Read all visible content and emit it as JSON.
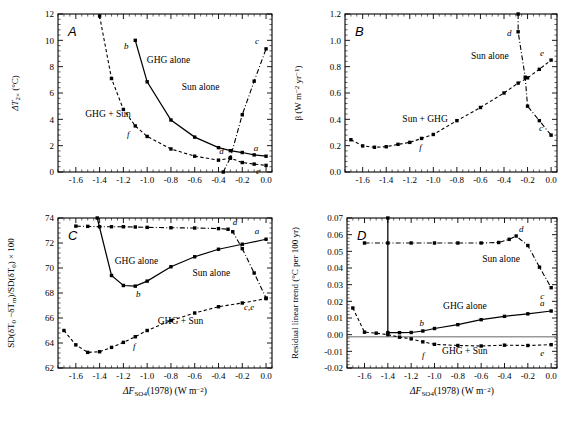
{
  "figure": {
    "xaxis_title": "ΔF",
    "xaxis_title_sub": "SO",
    "xaxis_title_sub2": "4",
    "xaxis_title_rest": "(1978) (W m",
    "xaxis_title_sup": "−2",
    "xaxis_title_end": ")",
    "xticks": [
      "-1.6",
      "-1.4",
      "-1.2",
      "-1.0",
      "-0.8",
      "-0.6",
      "-0.4",
      "-0.2",
      "0.0"
    ],
    "xlim": [
      -1.75,
      0.05
    ],
    "xtick_values": [
      -1.6,
      -1.4,
      -1.2,
      -1.0,
      -0.8,
      -0.6,
      -0.4,
      -0.2,
      0.0
    ]
  },
  "chart_data": [
    {
      "type": "line",
      "panel": "A",
      "title": "",
      "xlabel": "ΔF_SO4(1978) (W m−2)",
      "ylabel": "ΔT2x (°C)",
      "ylabel_main": "ΔT",
      "ylabel_sub": "2×",
      "ylabel_unit": "(°C)",
      "xlim": [
        -1.75,
        0.05
      ],
      "ylim": [
        0,
        12
      ],
      "yticks": [
        "0",
        "2",
        "4",
        "6",
        "8",
        "10",
        "12"
      ],
      "ytick_values": [
        0,
        2,
        4,
        6,
        8,
        10,
        12
      ],
      "grid": false,
      "series": [
        {
          "name": "GHG alone",
          "style": "solid",
          "label_x": -0.82,
          "label_y": 8.3,
          "x": [
            -1.1,
            -1.0,
            -0.8,
            -0.6,
            -0.4,
            -0.3,
            -0.2,
            -0.1,
            0.0
          ],
          "y": [
            10.0,
            6.85,
            3.95,
            2.65,
            1.85,
            1.62,
            1.48,
            1.3,
            1.2
          ]
        },
        {
          "name": "GHG + Sun",
          "style": "dashed",
          "label_x": -1.33,
          "label_y": 4.2,
          "x": [
            -1.4,
            -1.3,
            -1.2,
            -1.1,
            -1.0,
            -0.8,
            -0.6,
            -0.4,
            -0.3,
            -0.2,
            -0.1,
            0.0
          ],
          "y": [
            11.85,
            7.1,
            4.75,
            3.5,
            2.7,
            1.75,
            1.2,
            0.9,
            1.05,
            0.72,
            0.6,
            0.5
          ]
        },
        {
          "name": "Sun alone",
          "style": "dashdot",
          "label_x": -0.55,
          "label_y": 6.2,
          "x": [
            -0.36,
            -0.3,
            -0.2,
            -0.1,
            0.0
          ],
          "y": [
            0.0,
            1.1,
            4.35,
            6.9,
            9.35
          ]
        }
      ],
      "point_labels": [
        {
          "id": "a",
          "x": 0.0,
          "y": 1.2,
          "dx": -10,
          "dy": -5
        },
        {
          "id": "b",
          "x": -1.1,
          "y": 10.0,
          "dx": -9,
          "dy": 9
        },
        {
          "id": "c",
          "x": 0.0,
          "y": 9.35,
          "dx": -9,
          "dy": -5
        },
        {
          "id": "d",
          "x": -0.3,
          "y": 1.1,
          "dx": -9,
          "dy": -4
        },
        {
          "id": "e",
          "x": 0.0,
          "y": 0.5,
          "dx": -8,
          "dy": 9
        },
        {
          "id": "f",
          "x": -1.1,
          "y": 3.5,
          "dx": -7,
          "dy": 11
        }
      ]
    },
    {
      "type": "line",
      "panel": "B",
      "title": "",
      "xlabel": "ΔF_SO4(1978) (W m−2)",
      "ylabel": "β (W m−2 yr−1)",
      "ylabel_main": "β (W m",
      "ylabel_sup1": "−2",
      "ylabel_mid": " yr",
      "ylabel_sup2": "−1",
      "ylabel_end": ")",
      "xlim": [
        -1.75,
        0.05
      ],
      "ylim": [
        0.0,
        1.2
      ],
      "yticks": [
        "0.0",
        "0.2",
        "0.4",
        "0.6",
        "0.8",
        "1.0",
        "1.2"
      ],
      "ytick_values": [
        0.0,
        0.2,
        0.4,
        0.6,
        0.8,
        1.0,
        1.2
      ],
      "grid": false,
      "series": [
        {
          "name": "Sun + GHG",
          "style": "dashed",
          "label_x": -1.07,
          "label_y": 0.38,
          "x": [
            -1.7,
            -1.6,
            -1.5,
            -1.4,
            -1.3,
            -1.2,
            -1.1,
            -1.0,
            -0.8,
            -0.6,
            -0.4,
            -0.28,
            -0.2,
            -0.1,
            0.0
          ],
          "y": [
            0.245,
            0.198,
            0.188,
            0.192,
            0.21,
            0.225,
            0.255,
            0.285,
            0.39,
            0.49,
            0.6,
            0.675,
            0.715,
            0.78,
            0.85
          ]
        },
        {
          "name": "Sun alone",
          "style": "dashdot",
          "label_x": -0.52,
          "label_y": 0.855,
          "x": [
            -0.28,
            -0.28,
            -0.22,
            -0.2,
            -0.1,
            0.0
          ],
          "y": [
            1.2,
            1.065,
            0.72,
            0.5,
            0.39,
            0.28
          ]
        }
      ],
      "point_labels": [
        {
          "id": "c",
          "x": 0.0,
          "y": 0.28,
          "dx": -10,
          "dy": -4
        },
        {
          "id": "d",
          "x": -0.28,
          "y": 1.065,
          "dx": -9,
          "dy": 4
        },
        {
          "id": "e",
          "x": 0.0,
          "y": 0.85,
          "dx": -9,
          "dy": -4
        },
        {
          "id": "f",
          "x": -1.1,
          "y": 0.255,
          "dx": -1,
          "dy": 12
        }
      ]
    },
    {
      "type": "line",
      "panel": "C",
      "title": "",
      "xlabel": "ΔF_SO4(1978) (W m−2)",
      "ylabel": "SD(δT0 -δTm)/SD(δT0) × 100",
      "ylabel_p1": "SD(δT",
      "ylabel_s1": "0",
      "ylabel_p2": " −δT",
      "ylabel_s2": "m",
      "ylabel_p3": ")/SD(δT",
      "ylabel_s3": "0",
      "ylabel_p4": ") × 100",
      "xlim": [
        -1.75,
        0.05
      ],
      "ylim": [
        62,
        74
      ],
      "yticks": [
        "62",
        "64",
        "66",
        "68",
        "70",
        "72",
        "74"
      ],
      "ytick_values": [
        62,
        64,
        66,
        68,
        70,
        72,
        74
      ],
      "grid": false,
      "series": [
        {
          "name": "GHG alone",
          "style": "solid",
          "label_x": -1.09,
          "label_y": 70.3,
          "x": [
            -1.42,
            -1.3,
            -1.2,
            -1.1,
            -1.0,
            -0.8,
            -0.6,
            -0.4,
            -0.2,
            0.0
          ],
          "y": [
            74.0,
            69.4,
            68.6,
            68.55,
            68.95,
            70.1,
            70.9,
            71.5,
            71.9,
            72.3
          ]
        },
        {
          "name": "GHG + Sun",
          "style": "dashed",
          "label_x": -0.72,
          "label_y": 65.5,
          "x": [
            -1.7,
            -1.6,
            -1.5,
            -1.4,
            -1.3,
            -1.2,
            -1.1,
            -1.0,
            -0.8,
            -0.6,
            -0.4,
            -0.2,
            0.0
          ],
          "y": [
            65.0,
            63.85,
            63.25,
            63.3,
            63.65,
            64.05,
            64.5,
            65.0,
            65.8,
            66.4,
            66.9,
            67.2,
            67.55
          ]
        },
        {
          "name": "Sun alone",
          "style": "dashdot",
          "label_x": -0.46,
          "label_y": 69.4,
          "x": [
            -1.6,
            -1.5,
            -1.4,
            -1.3,
            -1.2,
            -1.1,
            -1.0,
            -0.8,
            -0.6,
            -0.4,
            -0.32,
            -0.28,
            -0.2,
            -0.1,
            0.0
          ],
          "y": [
            73.35,
            73.33,
            73.3,
            73.3,
            73.3,
            73.28,
            73.25,
            73.22,
            73.2,
            73.15,
            73.1,
            72.9,
            71.55,
            69.6,
            67.6
          ]
        }
      ],
      "point_labels": [
        {
          "id": "a",
          "x": 0.0,
          "y": 72.3,
          "dx": -9,
          "dy": -5
        },
        {
          "id": "b",
          "x": -1.1,
          "y": 68.55,
          "dx": 3,
          "dy": 11
        },
        {
          "id": "c,e",
          "x": 0.0,
          "y": 67.55,
          "dx": -17,
          "dy": 11
        },
        {
          "id": "d",
          "x": -0.32,
          "y": 73.1,
          "dx": 7,
          "dy": -4
        },
        {
          "id": "f",
          "x": -1.1,
          "y": 64.5,
          "dx": -1,
          "dy": 12
        }
      ]
    },
    {
      "type": "line",
      "panel": "D",
      "title": "",
      "xlabel": "ΔF_SO4(1978) (W m−2)",
      "ylabel": "Residual linear trend (°C per 100 yr)",
      "xlim": [
        -1.75,
        0.05
      ],
      "ylim": [
        -0.02,
        0.07
      ],
      "yticks": [
        "-0.02",
        "-0.01",
        "0.00",
        "0.01",
        "0.02",
        "0.03",
        "0.04",
        "0.05",
        "0.06",
        "0.07"
      ],
      "ytick_values": [
        -0.02,
        -0.01,
        0.0,
        0.01,
        0.02,
        0.03,
        0.04,
        0.05,
        0.06,
        0.07
      ],
      "grid": false,
      "zero_line": -0.0013,
      "series": [
        {
          "name": "GHG alone",
          "style": "solid",
          "label_x": -0.74,
          "label_y": 0.0155,
          "x": [
            -1.4,
            -1.4,
            -1.3,
            -1.2,
            -1.1,
            -1.0,
            -0.8,
            -0.6,
            -0.4,
            -0.2,
            0.0
          ],
          "y": [
            0.07,
            0.0012,
            0.0012,
            0.0013,
            0.0022,
            0.0037,
            0.006,
            0.009,
            0.011,
            0.0125,
            0.0142
          ]
        },
        {
          "name": "GHG + Sun",
          "style": "dashed",
          "label_x": -0.74,
          "label_y": -0.0115,
          "x": [
            -1.7,
            -1.6,
            -1.5,
            -1.4,
            -1.3,
            -1.2,
            -1.1,
            -1.0,
            -0.8,
            -0.6,
            -0.4,
            -0.2,
            0.0
          ],
          "y": [
            0.016,
            0.0015,
            0.0009,
            0.0,
            -0.0015,
            -0.0025,
            -0.0043,
            -0.0058,
            -0.0065,
            -0.0068,
            -0.0063,
            -0.0065,
            -0.006
          ]
        },
        {
          "name": "Sun alone",
          "style": "dashdot",
          "label_x": -0.43,
          "label_y": 0.0435,
          "x": [
            -1.6,
            -1.4,
            -1.2,
            -1.0,
            -0.8,
            -0.6,
            -0.45,
            -0.36,
            -0.3,
            -0.2,
            -0.1,
            0.0
          ],
          "y": [
            0.055,
            0.055,
            0.055,
            0.055,
            0.055,
            0.055,
            0.0553,
            0.0572,
            0.0592,
            0.0535,
            0.0405,
            0.0282
          ]
        }
      ],
      "point_labels": [
        {
          "id": "a",
          "x": 0.0,
          "y": 0.0142,
          "dx": -9,
          "dy": -5
        },
        {
          "id": "b",
          "x": -1.1,
          "y": 0.0022,
          "dx": -1,
          "dy": -5
        },
        {
          "id": "c",
          "x": 0.0,
          "y": 0.0282,
          "dx": -9,
          "dy": 11
        },
        {
          "id": "d",
          "x": -0.3,
          "y": 0.0592,
          "dx": 5,
          "dy": -4
        },
        {
          "id": "e",
          "x": 0.0,
          "y": -0.006,
          "dx": -9,
          "dy": 11
        },
        {
          "id": "f",
          "x": -1.08,
          "y": -0.0062,
          "dx": -2,
          "dy": 13
        }
      ]
    }
  ]
}
